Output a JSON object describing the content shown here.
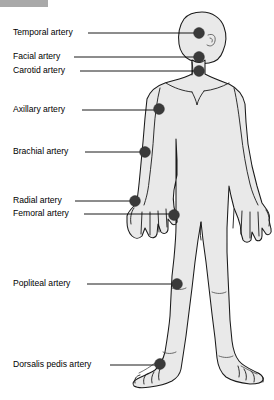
{
  "figure": {
    "width": 274,
    "height": 400,
    "background_color": "#ffffff",
    "body_fill_color": "#e9e9e9",
    "body_outline_color": "#1a1a1a",
    "dot_color": "#3a3a3a",
    "leader_color": "#000000",
    "text_color": "#000000"
  },
  "labels": [
    {
      "id": "temporal",
      "text": "Temporal artery",
      "text_x": 13,
      "text_y": 33,
      "leader_x1": 88,
      "leader_x2": 195,
      "leader_y": 33,
      "dot_x": 199,
      "dot_y": 33,
      "dot_r": 5.4
    },
    {
      "id": "facial",
      "text": "Facial artery",
      "text_x": 13,
      "text_y": 57,
      "leader_x1": 74,
      "leader_x2": 195,
      "leader_y": 57,
      "dot_x": 199,
      "dot_y": 57,
      "dot_r": 5.4
    },
    {
      "id": "carotid",
      "text": "Carotid artery",
      "text_x": 13,
      "text_y": 71,
      "leader_x1": 80,
      "leader_x2": 195,
      "leader_y": 71,
      "dot_x": 199,
      "dot_y": 71,
      "dot_r": 5.4
    },
    {
      "id": "axillary",
      "text": "Axillary artery",
      "text_x": 13,
      "text_y": 110,
      "leader_x1": 82,
      "leader_x2": 155,
      "leader_y": 110,
      "dot_x": 159,
      "dot_y": 109,
      "dot_r": 5.4
    },
    {
      "id": "brachial",
      "text": "Brachial artery",
      "text_x": 13,
      "text_y": 152,
      "leader_x1": 85,
      "leader_x2": 141,
      "leader_y": 152,
      "dot_x": 145,
      "dot_y": 152,
      "dot_r": 5.4
    },
    {
      "id": "radial",
      "text": "Radial artery",
      "text_x": 13,
      "text_y": 201,
      "leader_x1": 75,
      "leader_x2": 131,
      "leader_y": 201,
      "dot_x": 135,
      "dot_y": 201,
      "dot_r": 5.4
    },
    {
      "id": "femoral",
      "text": "Femoral artery",
      "text_x": 13,
      "text_y": 214,
      "leader_x1": 84,
      "leader_x2": 170,
      "leader_y": 214,
      "dot_x": 174,
      "dot_y": 215,
      "dot_r": 5.4
    },
    {
      "id": "popliteal",
      "text": "Popliteal artery",
      "text_x": 13,
      "text_y": 284,
      "leader_x1": 87,
      "leader_x2": 173,
      "leader_y": 284,
      "dot_x": 177,
      "dot_y": 284,
      "dot_r": 5.4
    },
    {
      "id": "dorsalis-pedis",
      "text": "Dorsalis pedis artery",
      "text_x": 13,
      "text_y": 365,
      "leader_x1": 110,
      "leader_x2": 156,
      "leader_y": 365,
      "dot_x": 160,
      "dot_y": 364,
      "dot_r": 5.4
    }
  ]
}
